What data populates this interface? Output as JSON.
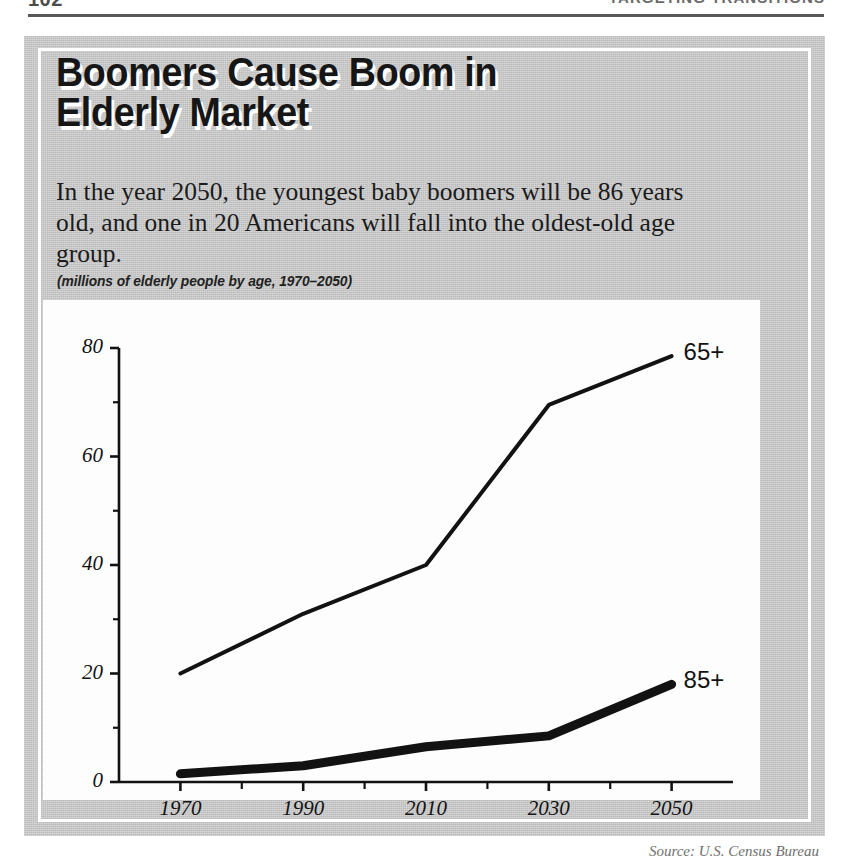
{
  "runhead": {
    "folio": "102",
    "title": "TARGETING TRANSITIONS"
  },
  "article": {
    "headline_line1": "Boomers Cause Boom in",
    "headline_line2": "Elderly Market",
    "deck": "In the year 2050, the youngest baby boomers will be 86 years old, and one in 20 Americans will fall into the oldest-old age group.",
    "caption": "(millions of elderly people by age, 1970–2050)",
    "source": "Source: U.S. Census Bureau"
  },
  "colors": {
    "panel": "#bcbcbc",
    "panel_border": "#ffffff",
    "plate": "#fdfdfd",
    "ink": "#121212",
    "rule": "#58585a"
  },
  "chart_data": {
    "type": "line",
    "title": "Boomers Cause Boom in Elderly Market",
    "subtitle": "(millions of elderly people by age, 1970–2050)",
    "xlabel": "",
    "ylabel": "",
    "x": [
      1970,
      1990,
      2010,
      2030,
      2050
    ],
    "xlim": [
      1960,
      2060
    ],
    "ylim": [
      0,
      80
    ],
    "yticks": [
      0,
      20,
      40,
      60,
      80
    ],
    "yticks_minor": [
      10,
      30,
      50,
      70
    ],
    "xticks": [
      1970,
      1990,
      2010,
      2030,
      2050
    ],
    "xticks_minor": [
      1980,
      2000,
      2020,
      2040
    ],
    "grid": false,
    "legend": "inline-right",
    "series": [
      {
        "name": "65+",
        "label": "65+",
        "values": [
          20,
          31,
          40,
          69.5,
          78.5
        ],
        "stroke_width": 4
      },
      {
        "name": "85+",
        "label": "85+",
        "values": [
          1.5,
          3,
          6.5,
          8.5,
          18
        ],
        "stroke_width": 9
      }
    ]
  },
  "axis": {
    "y_tick_labels": [
      "0",
      "20",
      "40",
      "60",
      "80"
    ],
    "x_tick_labels": [
      "1970",
      "1990",
      "2010",
      "2030",
      "2050"
    ]
  }
}
